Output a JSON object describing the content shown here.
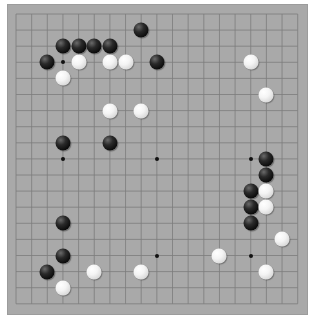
{
  "board": {
    "size": 19,
    "colors": {
      "background": "#ffffff",
      "board": "#a9a9a9",
      "grid_line": "#7c7c7c",
      "black_stone": "#0a0a0a",
      "white_stone": "#f4f4f4"
    },
    "geometry": {
      "x0": 16,
      "y0": 14,
      "dx": 15.65,
      "dy": 16.1
    },
    "star_points": [
      [
        3,
        3
      ],
      [
        9,
        3
      ],
      [
        15,
        3
      ],
      [
        3,
        9
      ],
      [
        9,
        9
      ],
      [
        15,
        9
      ],
      [
        3,
        15
      ],
      [
        9,
        15
      ],
      [
        15,
        15
      ]
    ],
    "stones": {
      "black": [
        [
          8,
          1
        ],
        [
          3,
          2
        ],
        [
          4,
          2
        ],
        [
          5,
          2
        ],
        [
          6,
          2
        ],
        [
          2,
          3
        ],
        [
          9,
          3
        ],
        [
          3,
          8
        ],
        [
          6,
          8
        ],
        [
          16,
          9
        ],
        [
          16,
          10
        ],
        [
          15,
          11
        ],
        [
          15,
          12
        ],
        [
          15,
          13
        ],
        [
          3,
          13
        ],
        [
          3,
          15
        ],
        [
          2,
          16
        ]
      ],
      "white": [
        [
          4,
          3
        ],
        [
          6,
          3
        ],
        [
          7,
          3
        ],
        [
          3,
          4
        ],
        [
          15,
          3
        ],
        [
          16,
          5
        ],
        [
          6,
          6
        ],
        [
          8,
          6
        ],
        [
          16,
          11
        ],
        [
          16,
          12
        ],
        [
          17,
          14
        ],
        [
          13,
          15
        ],
        [
          16,
          16
        ],
        [
          5,
          16
        ],
        [
          8,
          16
        ],
        [
          3,
          17
        ]
      ]
    }
  }
}
